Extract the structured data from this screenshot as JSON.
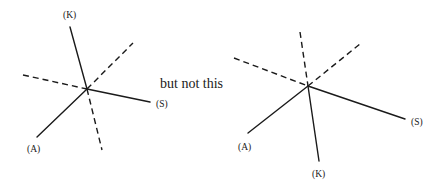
{
  "caption": "but not this",
  "diagrams": [
    {
      "name": "correct",
      "labels": {
        "k": "(K)",
        "s": "(S)",
        "a": "(A)"
      }
    },
    {
      "name": "incorrect",
      "labels": {
        "k": "(K)",
        "s": "(S)",
        "a": "(A)"
      }
    }
  ]
}
